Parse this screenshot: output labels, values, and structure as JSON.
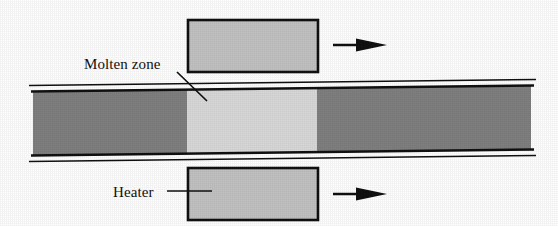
{
  "figure": {
    "background_color": "#ffffff"
  },
  "labels": {
    "molten_zone": "Molten zone",
    "heater": "Heater"
  },
  "colors": {
    "ingot_solid": "#808080",
    "molten_zone": "#d9d9d9",
    "heater_block": "#c2c2c2",
    "outline": "#101010",
    "tube_wall": "#101010",
    "background": "#ffffff",
    "arrow": "#101010"
  },
  "geometry": {
    "ingot": {
      "left": 33,
      "right": 531,
      "top": 86,
      "bottom": 155,
      "tilt_px": -6
    },
    "molten_zone": {
      "left": 187,
      "right": 317
    },
    "heater_top": {
      "left": 188,
      "top": 20,
      "width": 130,
      "height": 52
    },
    "heater_bottom": {
      "left": 188,
      "top": 168,
      "width": 130,
      "height": 52
    },
    "arrow_top": {
      "x1": 333,
      "x2": 387,
      "y": 45
    },
    "arrow_bottom": {
      "x1": 333,
      "x2": 387,
      "y": 194
    },
    "leader_molten_zone": {
      "x1": 177,
      "y1": 72,
      "x2": 207,
      "y2": 101
    },
    "leader_heater": {
      "x1": 167,
      "y1": 191,
      "x2": 212,
      "y2": 191
    }
  },
  "elements": {
    "ingot_name": "silicon ingot / rod",
    "molten_zone_name": "molten zone",
    "heater_top_name": "upper heater block",
    "heater_bottom_name": "lower heater block",
    "arrow_top_name": "heater travel direction arrow (top)",
    "arrow_bottom_name": "heater travel direction arrow (bottom)"
  }
}
